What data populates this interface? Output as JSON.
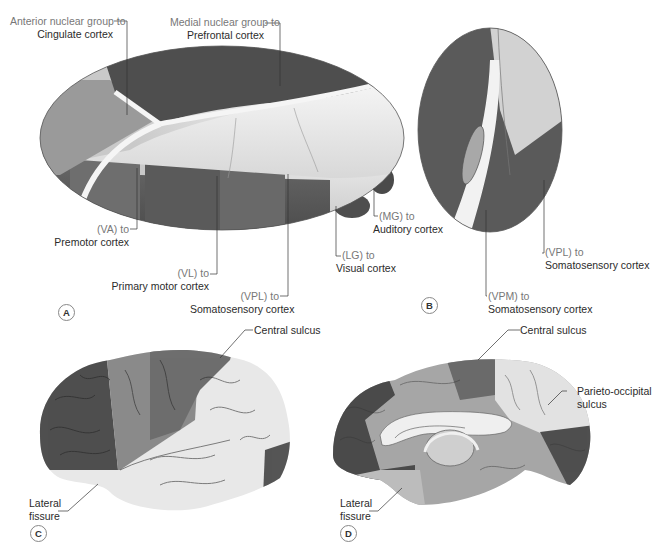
{
  "panels": {
    "A": {
      "letter": "A",
      "title": "Thalamic nuclei projections (lateral view)",
      "labels": {
        "anterior": {
          "line1": "Anterior nuclear group to",
          "line2": "Cingulate cortex"
        },
        "medial": {
          "line1": "Medial nuclear group to",
          "line2": "Prefrontal cortex"
        },
        "va": {
          "line1": "(VA) to",
          "line2": "Premotor cortex"
        },
        "vl": {
          "line1": "(VL) to",
          "line2": "Primary motor cortex"
        },
        "vpl": {
          "line1": "(VPL) to",
          "line2": "Somatosensory cortex"
        },
        "lg": {
          "line1": "(LG) to",
          "line2": "Visual cortex"
        },
        "mg": {
          "line1": "(MG) to",
          "line2": "Auditory cortex"
        }
      }
    },
    "B": {
      "letter": "B",
      "title": "Thalamus cross-section",
      "labels": {
        "vpl": {
          "line1": "(VPL) to",
          "line2": "Somatosensory cortex"
        },
        "vpm": {
          "line1": "(VPM) to",
          "line2": "Somatosensory cortex"
        }
      }
    },
    "C": {
      "letter": "C",
      "title": "Lateral brain surface",
      "labels": {
        "central": {
          "line1": "Central sulcus"
        },
        "lateral": {
          "line1": "Lateral",
          "line2": "fissure"
        }
      }
    },
    "D": {
      "letter": "D",
      "title": "Medial brain surface",
      "labels": {
        "central": {
          "line1": "Central sulcus"
        },
        "parieto": {
          "line1": "Parieto-occipital",
          "line2": "sulcus"
        },
        "lateral": {
          "line1": "Lateral",
          "line2": "fissure"
        }
      }
    }
  },
  "colors": {
    "darkest": "#4a4a4a",
    "dark": "#5e5e5e",
    "mid": "#7a7a7a",
    "light": "#a8a8a8",
    "lightest": "#e6e6e6",
    "leader": "#333333"
  }
}
